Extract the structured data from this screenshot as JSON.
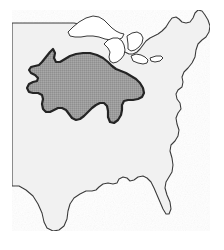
{
  "figure": {
    "name": "eastern-united-states-map",
    "width": 224,
    "height": 250,
    "background_color": "#ffffff"
  },
  "basemap": {
    "name": "eastern-us-landmass",
    "fill_color": "#f1f1f1",
    "stroke_color": "#3a3a3a",
    "stroke_width": 1.1,
    "features": [
      "western-boundary-line",
      "great-lakes",
      "atlantic-coast",
      "florida-peninsula",
      "gulf-coast"
    ],
    "outline_path": "M 12,23 L 12,186 L 19,186 L 26,190 L 33,196 L 38,204 L 42,213 L 44,222 L 47,228 L 53,231 L 59,230 L 64,226 L 67,219 L 68,211 L 70,204 L 74,198 L 80,194 L 86,191 L 92,191 L 96,190 L 99,187 L 103,184 L 108,183 L 113,184 L 117,183 L 119,179 L 123,177 L 127,178 L 130,181 L 134,180 L 138,177 L 143,176 L 147,178 L 151,182 L 154,188 L 157,195 L 160,202 L 163,209 L 166,214 L 169,214 L 171,209 L 170,202 L 167,195 L 165,188 L 166,182 L 169,177 L 172,172 L 173,165 L 172,158 L 170,151 L 171,145 L 175,141 L 178,136 L 179,130 L 177,124 L 176,118 L 178,113 L 181,109 L 180,103 L 177,99 L 176,94 L 178,90 L 182,87 L 183,82 L 182,77 L 184,72 L 188,68 L 192,63 L 195,57 L 196,50 L 198,44 L 202,40 L 206,37 L 209,32 L 210,26 L 208,20 L 205,15 L 202,11 L 198,10 L 195,13 L 193,18 L 190,22 L 186,23 L 182,22 L 179,19 L 176,17 L 172,18 L 169,22 L 166,27 L 162,31 L 158,34 L 154,36 L 150,38 L 146,41 L 143,45 L 140,49 L 137,52 L 133,54 L 129,54 L 125,52 L 121,49 L 118,45 L 115,41 L 112,37 L 108,34 L 104,32 L 100,31 L 96,30 L 92,28 L 88,26 L 84,25 L 79,24 L 74,23 L 69,23 L 63,23 L 57,23 L 50,23 L 43,23 L 36,23 L 28,23 Z",
    "great_lakes_paths": [
      "M 68,32 L 73,27 L 79,22 L 86,18 L 93,16 L 99,17 L 104,20 L 108,24 L 112,28 L 116,31 L 120,33 L 124,34 L 122,38 L 117,40 L 111,40 L 105,39 L 99,37 L 93,36 L 87,36 L 81,37 L 75,37 L 70,36 Z",
      "M 104,44 L 108,40 L 113,38 L 118,38 L 122,41 L 124,45 L 125,50 L 124,55 L 121,59 L 117,62 L 113,63 L 110,61 L 109,57 L 110,52 L 108,48 Z",
      "M 127,36 L 132,33 L 137,32 L 141,34 L 143,38 L 142,43 L 139,47 L 135,50 L 131,51 L 128,49 L 128,44 Z",
      "M 131,56 L 136,54 L 141,55 L 145,57 L 148,60 L 147,63 L 143,64 L 138,63 L 133,61 Z",
      "M 150,58 L 156,56 L 161,56 L 163,58 L 160,61 L 155,62 L 151,61 Z"
    ]
  },
  "shaded_region": {
    "name": "highlighted-region",
    "fill_color": "#9b9b9b",
    "stroke_color": "#242424",
    "stroke_width": 2.2,
    "label": "",
    "location_description": "Upper Midwest / Corn Belt",
    "path": "M 46,57 L 50,52 L 53,49 L 55,53 L 54,58 L 56,62 L 60,62 L 65,59 L 70,56 L 76,54 L 83,53 L 90,53 L 97,55 L 103,58 L 108,62 L 112,66 L 116,69 L 121,71 L 126,73 L 131,76 L 136,79 L 140,83 L 143,88 L 144,93 L 142,97 L 138,99 L 133,100 L 128,100 L 124,101 L 122,105 L 122,110 L 121,115 L 118,120 L 114,123 L 110,122 L 108,117 L 108,111 L 107,106 L 104,103 L 100,103 L 96,105 L 92,108 L 88,112 L 84,116 L 80,119 L 76,120 L 72,118 L 69,114 L 66,110 L 62,108 L 58,108 L 54,110 L 50,112 L 46,112 L 43,109 L 42,104 L 43,99 L 42,95 L 38,93 L 33,93 L 29,92 L 27,88 L 29,84 L 33,82 L 37,81 L 38,78 L 35,75 L 31,73 L 29,70 L 31,67 L 35,66 L 39,65 L 42,62 Z"
  }
}
